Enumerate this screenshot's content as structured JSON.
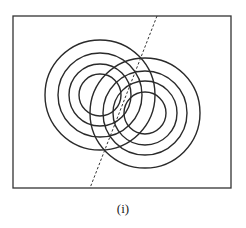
{
  "figure": {
    "caption": "(i)",
    "frame": {
      "x": 13,
      "y": 16,
      "width": 218,
      "height": 172,
      "stroke": "#333333"
    },
    "left_source": {
      "cx": 100,
      "cy": 95,
      "radii": [
        55,
        42,
        31,
        21
      ],
      "stroke": "#2a2a2a"
    },
    "right_source": {
      "cx": 145,
      "cy": 113,
      "radii": [
        55,
        42,
        32,
        21
      ],
      "stroke": "#2a2a2a"
    },
    "dashed_line": {
      "x1": 157,
      "y1": 16,
      "x2": 90,
      "y2": 188,
      "stroke": "#333333"
    }
  }
}
